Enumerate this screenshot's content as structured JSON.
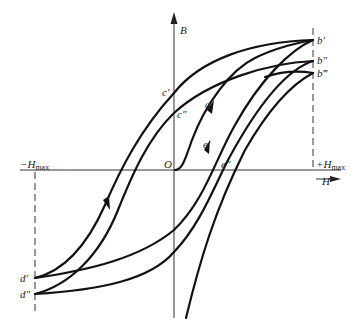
{
  "diagram": {
    "type": "hysteresis-loop",
    "axes": {
      "vertical_label": "B",
      "horizontal_label": "H",
      "origin_label": "O"
    },
    "limits": {
      "negative": {
        "prefix": "−H",
        "sub": "max"
      },
      "positive": {
        "prefix": "+H",
        "sub": "max"
      }
    },
    "points": {
      "b1": "b′",
      "b2": "b″",
      "b3": "b‴",
      "c1": "c′",
      "c2": "c″",
      "d1": "d′",
      "d2": "d″",
      "a": "a",
      "e1": "e′",
      "e2": "e″"
    }
  }
}
